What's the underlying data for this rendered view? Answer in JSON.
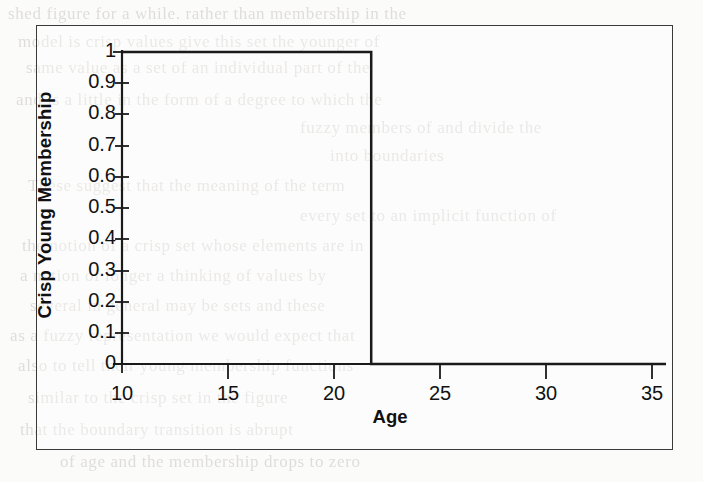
{
  "page": {
    "background_color": "#fbfbfa",
    "figure_border_color": "#3a3a3a",
    "ink_color": "#111111",
    "ghost_text_color": "#c9c6c2"
  },
  "figure": {
    "x_axis_title": "Age",
    "y_axis_title": "Crisp Young Membership"
  },
  "chart_data": {
    "type": "line",
    "title": "",
    "subtitle": "",
    "xlabel": "Age",
    "ylabel": "Crisp Young Membership",
    "xlim": [
      10,
      36.2
    ],
    "ylim": [
      0,
      1
    ],
    "xticks": [
      10,
      15,
      20,
      25,
      30,
      35
    ],
    "xtick_labels": [
      "10",
      "15",
      "20",
      "25",
      "30",
      "35"
    ],
    "yticks": [
      0,
      0.1,
      0.2,
      0.3,
      0.4,
      0.5,
      0.6,
      0.7,
      0.8,
      0.9,
      1
    ],
    "ytick_labels": [
      "0",
      "0.1",
      "0.2",
      "0.3",
      "0.4",
      "0.5",
      "0.6",
      "0.7",
      "0.8",
      "0.9",
      "1"
    ],
    "grid": false,
    "legend": false,
    "legend_position": "none",
    "threshold_age": 22,
    "series": [
      {
        "name": "Crisp Young Membership",
        "color": "#1a1a1a",
        "line_width": 2.5,
        "x": [
          10,
          22,
          22,
          36.2
        ],
        "values": [
          1,
          1,
          0,
          0
        ]
      }
    ],
    "annotations": [
      "Step function: membership = 1 for Age <= 22, membership = 0 for Age > 22"
    ]
  },
  "ghost_text": {
    "lines": [
      {
        "text": "shed  figure   for  a  while.  rather  than  membership  in  the",
        "x": 8,
        "y": 4
      },
      {
        "text": "model  is  crisp  values   give  this   set  the  younger  of",
        "x": 18,
        "y": 32
      },
      {
        "text": "same  value  as  a  set  of  an  individual  part  of  the",
        "x": 26,
        "y": 58
      },
      {
        "text": "and  is  a  little   in  the   form  of  a  degree  to  which  the",
        "x": 16,
        "y": 90
      },
      {
        "text": "fuzzy   members  of  and  divide  the",
        "x": 300,
        "y": 118
      },
      {
        "text": "into  boundaries",
        "x": 330,
        "y": 146
      },
      {
        "text": "These   suggest  that  the  meaning  of   the   term",
        "x": 28,
        "y": 176
      },
      {
        "text": "every  set  to  an  implicit  function  of",
        "x": 300,
        "y": 206
      },
      {
        "text": "the   notion  of   a   crisp  set  whose  elements  are  in",
        "x": 22,
        "y": 236
      },
      {
        "text": "a  notion   of   longer   a   thinking  of  values  by",
        "x": 20,
        "y": 266
      },
      {
        "text": "several   in  general  may  be  sets  and  these",
        "x": 30,
        "y": 296
      },
      {
        "text": "as  a  fuzzy  representation  we  would  expect  that",
        "x": 10,
        "y": 326
      },
      {
        "text": "also  to  tell  their  young  membership  functions",
        "x": 18,
        "y": 356
      },
      {
        "text": "similar  to  the  crisp  set  in  the  figure",
        "x": 28,
        "y": 388
      },
      {
        "text": "that  the  boundary  transition  is  abrupt",
        "x": 20,
        "y": 420
      },
      {
        "text": "of  age  and  the  membership  drops  to  zero",
        "x": 60,
        "y": 452
      }
    ]
  }
}
